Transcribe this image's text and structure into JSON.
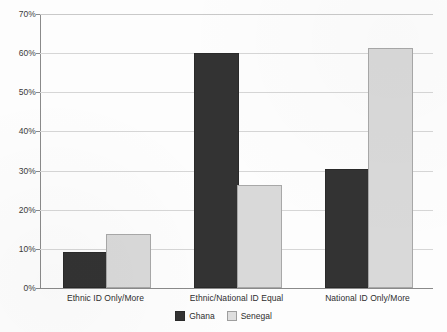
{
  "chart_data": {
    "type": "bar",
    "title": "",
    "subtitle": "",
    "xlabel": "",
    "ylabel": "",
    "categories": [
      "Ethnic ID Only/More",
      "Ethnic/National ID Equal",
      "National ID Only/More"
    ],
    "series": [
      {
        "name": "Ghana",
        "color": "#333333",
        "values": [
          8.8,
          59.5,
          29.8
        ]
      },
      {
        "name": "Senegal",
        "color": "#d9d9d9",
        "values": [
          13.2,
          25.8,
          60.8
        ]
      }
    ],
    "ylim": [
      0,
      70
    ],
    "ytick_labels": [
      "70%",
      "60%",
      "50%",
      "40%",
      "30%",
      "20%",
      "10%",
      "0%"
    ],
    "ytick_values": [
      70,
      60,
      50,
      40,
      30,
      20,
      10,
      0
    ],
    "grid": true,
    "legend_position": "bottom"
  }
}
